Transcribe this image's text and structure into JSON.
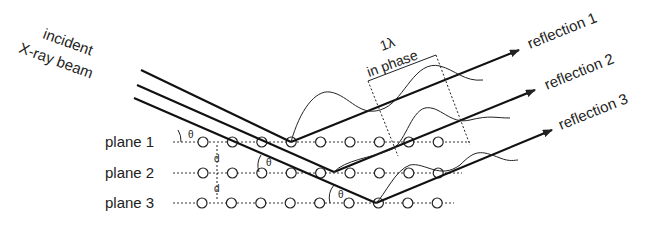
{
  "incident_label_line1": "incident",
  "incident_label_line2": "X-ray beam",
  "wavelength_label": "1λ",
  "phase_label": "in phase",
  "planes": [
    {
      "label": "plane 1"
    },
    {
      "label": "plane 2"
    },
    {
      "label": "plane 3"
    }
  ],
  "reflections": [
    {
      "label": "reflection 1"
    },
    {
      "label": "reflection 2"
    },
    {
      "label": "reflection 3"
    }
  ],
  "angle_symbol": "θ",
  "spacing_symbol": "d",
  "colors": {
    "ink": "#222222",
    "background": "#ffffff"
  }
}
